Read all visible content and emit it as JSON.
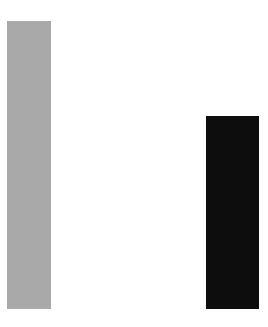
{
  "canvas": {
    "width": 268,
    "height": 327,
    "background": "#ffffff"
  },
  "chart_data": {
    "type": "bar",
    "title": "",
    "subtitle": "",
    "xlabel": "",
    "ylabel": "",
    "categories": [
      "",
      ""
    ],
    "values": [
      288,
      193
    ],
    "value_unit": "px",
    "ylim": [
      0,
      327
    ],
    "baseline_y": 309,
    "grid": false,
    "axes_visible": false,
    "tick_labels": [],
    "legend": {
      "visible": false,
      "position": "none",
      "entries": []
    },
    "annotations": [],
    "orientation": "vertical",
    "series": [
      {
        "name": "bar-1",
        "color": "#a9a9a9",
        "color_name": "gray",
        "value": 288,
        "x": 7,
        "y": 21,
        "width": 44,
        "height": 288
      },
      {
        "name": "bar-2",
        "color": "#0d0d0d",
        "color_name": "black",
        "value": 193,
        "x": 206,
        "y": 116,
        "width": 53,
        "height": 193
      }
    ]
  }
}
